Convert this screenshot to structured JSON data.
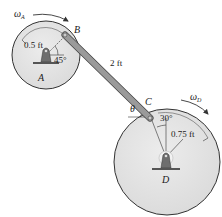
{
  "diagram": {
    "type": "four-bar linkage (two disks connected by a rod)",
    "colors": {
      "disk_fill": "#e6e6e6",
      "disk_stroke": "#333333",
      "rod_fill": "#9a9a9a",
      "rod_stroke": "#444444",
      "support_fill": "#6e6e6e",
      "text": "#1a1a1a"
    },
    "disk_A": {
      "label": "A",
      "radius_label": "0.5 ft",
      "angle_label": "45°",
      "omega_symbol": "ω",
      "omega_sub": "A"
    },
    "disk_D": {
      "label": "D",
      "radius_label": "0.75 ft",
      "angle_label": "30°",
      "omega_symbol": "ω",
      "omega_sub": "D"
    },
    "rod": {
      "length_label": "2 ft",
      "end_B_label": "B",
      "end_C_label": "C",
      "angle_label": "θ"
    }
  }
}
